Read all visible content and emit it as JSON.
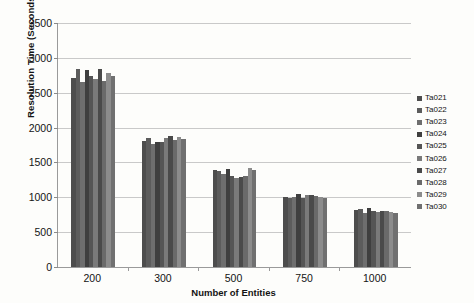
{
  "chart_data": {
    "type": "bar",
    "title": "",
    "xlabel": "Number of Entities",
    "ylabel": "Resolution Time (Seconds)",
    "categories": [
      "200",
      "300",
      "500",
      "750",
      "1000"
    ],
    "ylim": [
      0,
      3500
    ],
    "ytick_values": [
      0,
      500,
      1000,
      1500,
      2000,
      2500,
      3000,
      3500
    ],
    "ytick_labels": [
      "0",
      "500",
      "1000",
      "1500",
      "2000",
      "2500",
      "3000",
      "3500"
    ],
    "grid": true,
    "legend_position": "right",
    "series": [
      {
        "name": "Ta021",
        "color": "#4d4d4d",
        "values": [
          2705,
          1810,
          1385,
          1000,
          820
        ]
      },
      {
        "name": "Ta022",
        "color": "#5c5c5c",
        "values": [
          2845,
          1855,
          1375,
          995,
          830
        ]
      },
      {
        "name": "Ta023",
        "color": "#6e6e6e",
        "values": [
          2660,
          1760,
          1340,
          1000,
          775
        ]
      },
      {
        "name": "Ta024",
        "color": "#3f3f3f",
        "values": [
          2825,
          1800,
          1400,
          1045,
          840
        ]
      },
      {
        "name": "Ta025",
        "color": "#555555",
        "values": [
          2745,
          1790,
          1300,
          995,
          805
        ]
      },
      {
        "name": "Ta026",
        "color": "#7a7a7a",
        "values": [
          2695,
          1855,
          1270,
          1030,
          790
        ]
      },
      {
        "name": "Ta027",
        "color": "#4a4a4a",
        "values": [
          2840,
          1880,
          1290,
          1035,
          800
        ]
      },
      {
        "name": "Ta028",
        "color": "#6a6a6a",
        "values": [
          2670,
          1815,
          1305,
          1020,
          800
        ]
      },
      {
        "name": "Ta029",
        "color": "#8c8c8c",
        "values": [
          2790,
          1870,
          1420,
          1010,
          790
        ]
      },
      {
        "name": "Ta030",
        "color": "#707070",
        "values": [
          2745,
          1830,
          1385,
          995,
          770
        ]
      }
    ]
  }
}
